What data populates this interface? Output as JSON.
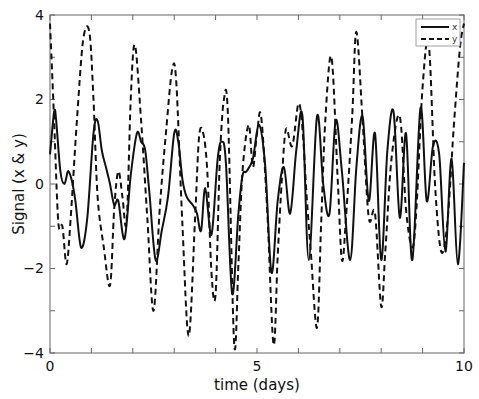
{
  "chart_data": {
    "type": "line",
    "title": "",
    "xlabel": "time (days)",
    "ylabel": "Signal (x & y)",
    "xlim": [
      0,
      10
    ],
    "ylim": [
      -4,
      4
    ],
    "xticks": [
      0,
      5,
      10
    ],
    "xminor_ticks": [
      1,
      2,
      3,
      4,
      6,
      7,
      8,
      9
    ],
    "yticks": [
      -4,
      -2,
      0,
      2,
      4
    ],
    "yminor_ticks": [
      -3,
      -1,
      1,
      3
    ],
    "grid": false,
    "legend": {
      "position": "upper right",
      "entries": [
        "x",
        "y"
      ]
    },
    "series": [
      {
        "name": "x",
        "style": "solid",
        "x": [
          0.0,
          0.1,
          0.15,
          0.25,
          0.35,
          0.45,
          0.6,
          0.75,
          0.9,
          1.05,
          1.15,
          1.25,
          1.35,
          1.45,
          1.55,
          1.65,
          1.8,
          1.95,
          2.1,
          2.2,
          2.3,
          2.4,
          2.55,
          2.7,
          2.85,
          3.0,
          3.1,
          3.2,
          3.3,
          3.45,
          3.55,
          3.65,
          3.75,
          3.9,
          4.05,
          4.15,
          4.25,
          4.4,
          4.55,
          4.65,
          4.75,
          4.9,
          5.05,
          5.2,
          5.35,
          5.5,
          5.65,
          5.8,
          5.95,
          6.1,
          6.25,
          6.45,
          6.6,
          6.75,
          6.9,
          7.05,
          7.25,
          7.4,
          7.55,
          7.7,
          7.85,
          8.0,
          8.15,
          8.3,
          8.45,
          8.6,
          8.75,
          8.95,
          9.1,
          9.25,
          9.4,
          9.55,
          9.7,
          9.85,
          10.0
        ],
        "y": [
          0.7,
          1.7,
          1.5,
          0.3,
          0.0,
          0.3,
          -0.3,
          -1.5,
          -0.8,
          1.2,
          1.5,
          0.8,
          0.4,
          0.0,
          -0.5,
          -0.4,
          -1.3,
          0.2,
          1.2,
          1.0,
          0.8,
          -0.2,
          -1.8,
          -1.1,
          -0.3,
          1.2,
          1.0,
          0.1,
          -0.3,
          -0.5,
          -0.7,
          -1.1,
          -0.1,
          -1.2,
          0.6,
          1.0,
          0.5,
          -2.6,
          -0.7,
          0.2,
          0.3,
          0.6,
          1.4,
          0.4,
          -2.1,
          -0.4,
          0.4,
          -0.7,
          0.8,
          1.6,
          -1.8,
          1.6,
          0.0,
          -0.7,
          1.5,
          0.3,
          -1.8,
          0.4,
          1.6,
          -0.4,
          1.2,
          -1.8,
          0.8,
          1.7,
          -0.8,
          1.2,
          -1.8,
          1.8,
          -0.4,
          0.9,
          0.7,
          -1.6,
          0.6,
          -1.9,
          0.5
        ]
      },
      {
        "name": "y",
        "style": "dashed",
        "x": [
          0.0,
          0.1,
          0.2,
          0.3,
          0.4,
          0.5,
          0.65,
          0.8,
          0.95,
          1.05,
          1.15,
          1.3,
          1.45,
          1.55,
          1.65,
          1.75,
          1.85,
          1.95,
          2.05,
          2.2,
          2.35,
          2.5,
          2.65,
          2.8,
          2.95,
          3.05,
          3.2,
          3.35,
          3.5,
          3.6,
          3.7,
          3.8,
          3.9,
          4.0,
          4.1,
          4.2,
          4.3,
          4.45,
          4.55,
          4.65,
          4.8,
          4.9,
          5.0,
          5.1,
          5.25,
          5.4,
          5.5,
          5.6,
          5.7,
          5.85,
          6.0,
          6.1,
          6.2,
          6.3,
          6.45,
          6.55,
          6.65,
          6.8,
          6.95,
          7.05,
          7.15,
          7.3,
          7.4,
          7.55,
          7.7,
          7.85,
          8.0,
          8.1,
          8.25,
          8.45,
          8.6,
          8.75,
          8.85,
          9.0,
          9.15,
          9.3,
          9.45,
          9.6,
          9.75,
          9.9,
          10.0
        ],
        "y": [
          3.8,
          1.5,
          -0.9,
          -1.0,
          -1.9,
          -0.8,
          1.5,
          3.4,
          3.6,
          2.0,
          -0.3,
          -1.5,
          -2.4,
          -0.6,
          0.3,
          -0.3,
          -0.9,
          2.0,
          3.3,
          1.5,
          -0.8,
          -3.0,
          -0.6,
          1.2,
          2.7,
          2.4,
          -1.0,
          -3.6,
          -0.9,
          1.1,
          1.2,
          0.3,
          -2.1,
          -2.6,
          0.5,
          2.0,
          1.6,
          -3.8,
          -1.9,
          0.3,
          1.4,
          0.4,
          1.2,
          1.6,
          -0.7,
          -3.8,
          -1.7,
          0.1,
          1.3,
          0.9,
          1.9,
          1.3,
          -0.3,
          -1.6,
          -3.4,
          -0.9,
          1.5,
          3.0,
          0.1,
          -1.8,
          -0.8,
          1.6,
          3.6,
          1.5,
          -0.8,
          -0.7,
          -2.9,
          -1.6,
          0.6,
          1.6,
          -0.6,
          -1.5,
          -0.6,
          2.3,
          3.3,
          0.0,
          -1.6,
          -0.9,
          1.3,
          3.2,
          3.8
        ]
      }
    ]
  },
  "legend": {
    "x_label": "x",
    "y_label": "y"
  },
  "axes": {
    "xlabel": "time (days)",
    "ylabel": "Signal (x & y)",
    "xtick_labels": [
      "0",
      "5",
      "10"
    ],
    "ytick_labels": [
      "4",
      "2",
      "0",
      "−2",
      "−4"
    ]
  },
  "colors": {
    "line": "#111111",
    "axis": "#555555",
    "background": "#ffffff"
  }
}
